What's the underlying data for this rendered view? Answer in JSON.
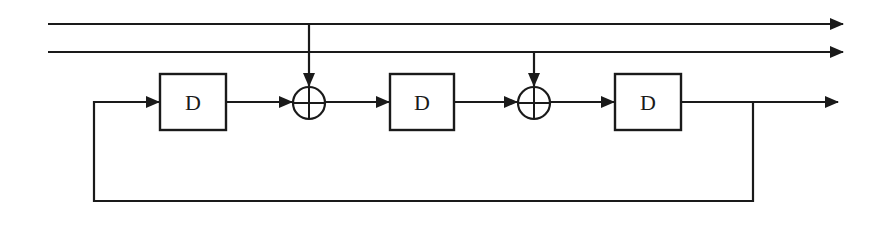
{
  "diagram": {
    "type": "shift-register / LFSR block diagram",
    "colors": {
      "stroke": "#1a1a1a",
      "background": "#ffffff"
    },
    "blocks": [
      {
        "id": "delay-1",
        "label": "D"
      },
      {
        "id": "delay-2",
        "label": "D"
      },
      {
        "id": "delay-3",
        "label": "D"
      }
    ],
    "adders": [
      {
        "id": "adder-1",
        "symbol": "xor-adder-icon"
      },
      {
        "id": "adder-2",
        "symbol": "xor-adder-icon"
      }
    ],
    "lines": [
      {
        "id": "input-line-1",
        "description": "top line, taps into adder-1, exits right with arrow"
      },
      {
        "id": "input-line-2",
        "description": "second line, taps into adder-2, exits right with arrow"
      },
      {
        "id": "output-line",
        "description": "output of delay-3, exits right with arrow"
      },
      {
        "id": "feedback-loop",
        "description": "from output back to input of delay-1"
      }
    ]
  }
}
